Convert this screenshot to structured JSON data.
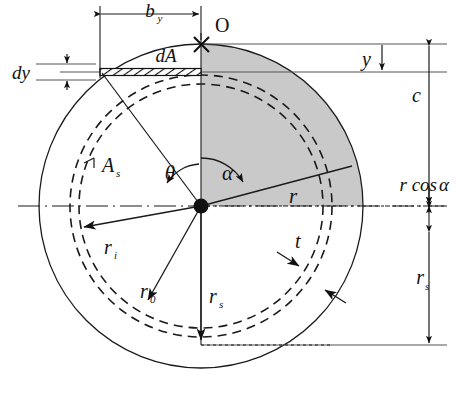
{
  "figure": {
    "type": "engineering-cross-section-diagram",
    "colors": {
      "line": "#1a1a1a",
      "shading": "#c9c9c9",
      "background": "#ffffff"
    },
    "geometry": {
      "center": {
        "x": 201,
        "y": 206
      },
      "outer_circle_radius": 162,
      "dashed_outer_radius": 131,
      "dashed_inner_radius": 122,
      "origin_point": {
        "x": 201,
        "y": 44,
        "label": "O"
      },
      "strip_y": 72,
      "strip_left_x": 100,
      "alpha_deg": 62,
      "theta_deg": 48
    },
    "labels": {
      "origin": "O",
      "width_by": "b",
      "width_by_sub": "y",
      "differential_area": "dA",
      "differential_height": "dy",
      "distance_y": "y",
      "distance_c": "c",
      "r_cos_alpha": "r cos",
      "r_cos_alpha_symbol": "α",
      "radius_r": "r",
      "thickness_t": "t",
      "shear_area": "A",
      "shear_area_sub": "s",
      "radius_inner": "r",
      "radius_inner_sub": "i",
      "radius_outer": "r",
      "radius_outer_sub": "0",
      "radius_s": "r",
      "radius_s_sub": "s",
      "radius_s_bottom": "r",
      "radius_s_bottom_sub": "s",
      "angle_theta": "θ",
      "angle_alpha": "α"
    }
  }
}
